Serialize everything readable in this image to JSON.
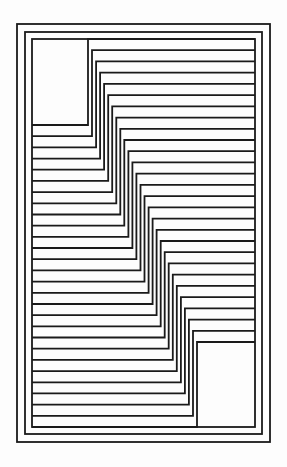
{
  "diagram": {
    "stroke_color": "#1a1a1a",
    "background": "#fdfdfd",
    "stroke_width": 1.8,
    "frames": [
      {
        "x1": 17,
        "y1": 24,
        "x2": 270,
        "y2": 442
      },
      {
        "x1": 25,
        "y1": 32,
        "x2": 262,
        "y2": 434
      },
      {
        "x1": 32,
        "y1": 39,
        "x2": 255,
        "y2": 427
      }
    ],
    "steps": {
      "count": 28,
      "left_x": 32,
      "right_x": 255,
      "corner_x_start": 88,
      "corner_x_end": 197,
      "low_y_start": 125,
      "low_y_end": 427,
      "high_y_start": 39,
      "high_y_end": 342
    },
    "top_left_box": {
      "x1": 32,
      "y1": 39,
      "x2": 88,
      "y2": 125
    },
    "bottom_right_box": {
      "x1": 197,
      "y1": 342,
      "x2": 255,
      "y2": 427
    }
  }
}
